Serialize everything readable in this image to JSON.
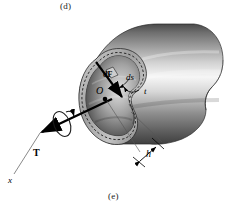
{
  "figure": {
    "domain_kind": "technical-illustration",
    "background_color": "#ffffff",
    "ink_color": "#000000",
    "shading": {
      "body_dark": "#4a4a4a",
      "body_mid": "#8c8c8c",
      "body_light": "#e9e9e9",
      "highlight": "#f7f7f7",
      "bore_dark": "#3d3d3d",
      "bore_mid": "#9a9a9a",
      "wall_edge": "#bdbdbd"
    }
  },
  "captions": {
    "top": "(d)",
    "bottom": "(e)"
  },
  "labels": {
    "force": "dF",
    "arc_length": "ds",
    "thickness": "t",
    "origin": "O",
    "torque": "T",
    "axis": "x",
    "median_distance": "h"
  }
}
